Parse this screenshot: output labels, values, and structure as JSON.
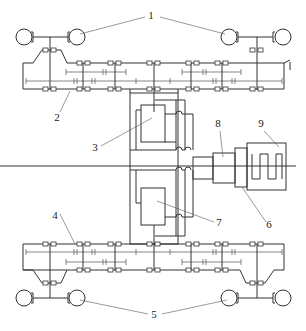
{
  "diagram": {
    "type": "mechanical-transmission-schematic",
    "labels": [
      {
        "id": "1",
        "text": "1",
        "x": 151,
        "y": 19
      },
      {
        "id": "2",
        "text": "2",
        "x": 57,
        "y": 121
      },
      {
        "id": "3",
        "text": "3",
        "x": 95,
        "y": 151
      },
      {
        "id": "4",
        "text": "4",
        "x": 55,
        "y": 219
      },
      {
        "id": "5",
        "text": "5",
        "x": 154,
        "y": 318
      },
      {
        "id": "6",
        "text": "6",
        "x": 269,
        "y": 228
      },
      {
        "id": "7",
        "text": "7",
        "x": 219,
        "y": 226
      },
      {
        "id": "8",
        "text": "8",
        "x": 218,
        "y": 127
      },
      {
        "id": "9",
        "text": "9",
        "x": 261,
        "y": 127
      }
    ],
    "components": [
      {
        "label": "1",
        "name": "upper wheels"
      },
      {
        "label": "2",
        "name": "upper gear train housing"
      },
      {
        "label": "3",
        "name": "upper motor block"
      },
      {
        "label": "4",
        "name": "lower gear train housing"
      },
      {
        "label": "5",
        "name": "lower wheels"
      },
      {
        "label": "6",
        "name": "coupling"
      },
      {
        "label": "7",
        "name": "lower motor block"
      },
      {
        "label": "8",
        "name": "shaft coupling"
      },
      {
        "label": "9",
        "name": "gearbox / engine"
      }
    ]
  }
}
